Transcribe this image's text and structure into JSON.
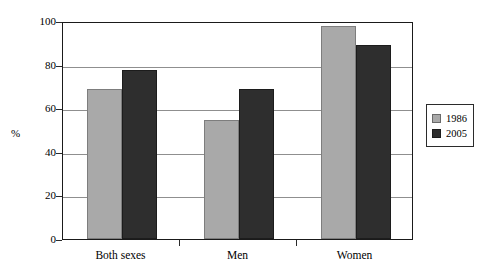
{
  "chart_data": {
    "type": "bar",
    "title": "",
    "xlabel": "",
    "ylabel": "%",
    "ylim": [
      0,
      100
    ],
    "yticks": [
      0,
      20,
      40,
      60,
      80,
      100
    ],
    "grid": true,
    "legend_position": "right-outside",
    "categories": [
      "Both sexes",
      "Men",
      "Women"
    ],
    "series": [
      {
        "name": "1986",
        "color": "#a9a9a9",
        "values": [
          69,
          54.5,
          97.5
        ]
      },
      {
        "name": "2005",
        "color": "#2e2e2e",
        "values": [
          77.5,
          69,
          89
        ]
      }
    ]
  },
  "legend": {
    "entries": [
      {
        "label": "1986"
      },
      {
        "label": "2005"
      }
    ]
  }
}
